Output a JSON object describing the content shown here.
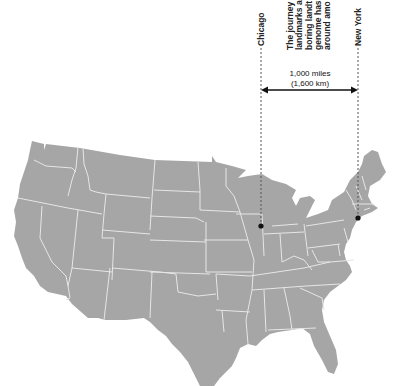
{
  "map": {
    "title": "Contiguous United States",
    "land_color": "#a6a6a6",
    "border_color": "#e6e6e6"
  },
  "cities": [
    {
      "name": "Chicago",
      "x": 261,
      "y": 226
    },
    {
      "name": "New York",
      "x": 358,
      "y": 218
    }
  ],
  "distance": {
    "miles": "1,000 miles",
    "km": "(1,600 km)"
  },
  "note": {
    "lines": [
      "The journey",
      "landmarks a",
      "boring landt",
      "genome has",
      "around amo"
    ]
  },
  "colors": {
    "accent": "#111111",
    "leader": "#555555"
  }
}
